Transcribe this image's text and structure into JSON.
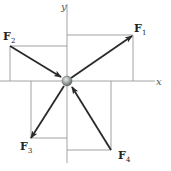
{
  "diagram": {
    "type": "force-diagram",
    "axes": {
      "x_label": "x",
      "y_label": "y",
      "color": "#9a9a9a"
    },
    "particle": {
      "name": "particle",
      "color": "#9aa0a0"
    },
    "forces": [
      {
        "id": "F1",
        "label": "F",
        "subscript": "1",
        "direction": "outward",
        "quadrant": "I"
      },
      {
        "id": "F2",
        "label": "F",
        "subscript": "2",
        "direction": "inward",
        "quadrant": "II"
      },
      {
        "id": "F3",
        "label": "F",
        "subscript": "3",
        "direction": "outward",
        "quadrant": "III"
      },
      {
        "id": "F4",
        "label": "F",
        "subscript": "4",
        "direction": "inward",
        "quadrant": "IV"
      }
    ],
    "arrow_color": "#2a2a2a",
    "guide_color": "#8a8a8a"
  }
}
